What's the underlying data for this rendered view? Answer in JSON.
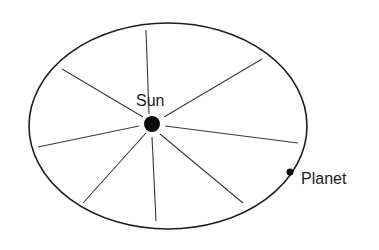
{
  "diagram": {
    "type": "kepler-equal-areas",
    "labels": {
      "sun": "Sun",
      "planet": "Planet"
    },
    "orbit": {
      "cx": 168,
      "cy": 126,
      "rx": 139,
      "ry": 103
    },
    "sun": {
      "cx": 152,
      "cy": 124,
      "r": 8
    },
    "planet": {
      "cx": 290,
      "cy": 172,
      "r": 3.5
    },
    "spokes": [
      {
        "from": [
          146,
          30
        ],
        "to": [
          149,
          114
        ]
      },
      {
        "from": [
          62,
          69
        ],
        "to": [
          143,
          117
        ]
      },
      {
        "from": [
          262,
          59
        ],
        "to": [
          164,
          117
        ]
      },
      {
        "from": [
          38,
          147
        ],
        "to": [
          139,
          126
        ]
      },
      {
        "from": [
          298,
          143
        ],
        "to": [
          165,
          126
        ]
      },
      {
        "from": [
          83,
          203
        ],
        "to": [
          146,
          133
        ]
      },
      {
        "from": [
          156,
          221
        ],
        "to": [
          152,
          137
        ]
      },
      {
        "from": [
          243,
          203
        ],
        "to": [
          160,
          134
        ]
      }
    ],
    "colors": {
      "line": "#1e1e1e",
      "spoke": "#3a3a3a",
      "fill": "#0d0d0d",
      "background": "#ffffff"
    }
  }
}
